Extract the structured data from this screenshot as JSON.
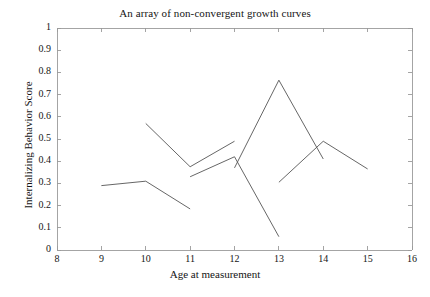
{
  "chart_data": {
    "type": "line",
    "title": "An array of non-convergent growth curves",
    "xlabel": "Age at measurement",
    "ylabel": "Internalizing Behavior Score",
    "xlim": [
      8,
      16
    ],
    "ylim": [
      0,
      1
    ],
    "xticks": [
      8,
      9,
      10,
      11,
      12,
      13,
      14,
      15,
      16
    ],
    "xtick_labels": [
      "8",
      "9",
      "10",
      "11",
      "12",
      "13",
      "14",
      "15",
      "16"
    ],
    "yticks": [
      0,
      0.1,
      0.2,
      0.3,
      0.4,
      0.5,
      0.6,
      0.7,
      0.8,
      0.9,
      1
    ],
    "ytick_labels": [
      "0",
      "0.1",
      "0.2",
      "0.3",
      "0.4",
      "0.5",
      "0.6",
      "0.7",
      "0.8",
      "0.9",
      "1"
    ],
    "grid": false,
    "legend": false,
    "legend_position": "none",
    "line_color": "#555555",
    "axis_color": "#9a9a9a",
    "background": "#ffffff",
    "series": [
      {
        "name": "curve-1",
        "x": [
          9,
          10,
          11
        ],
        "y": [
          0.29,
          0.31,
          0.185
        ]
      },
      {
        "name": "curve-2",
        "x": [
          10,
          11,
          12
        ],
        "y": [
          0.57,
          0.375,
          0.49
        ]
      },
      {
        "name": "curve-3",
        "x": [
          11,
          12,
          13
        ],
        "y": [
          0.33,
          0.42,
          0.06
        ]
      },
      {
        "name": "curve-4",
        "x": [
          12,
          13,
          14
        ],
        "y": [
          0.37,
          0.765,
          0.41
        ]
      },
      {
        "name": "curve-5",
        "x": [
          13,
          14,
          15
        ],
        "y": [
          0.305,
          0.49,
          0.365
        ]
      }
    ]
  }
}
